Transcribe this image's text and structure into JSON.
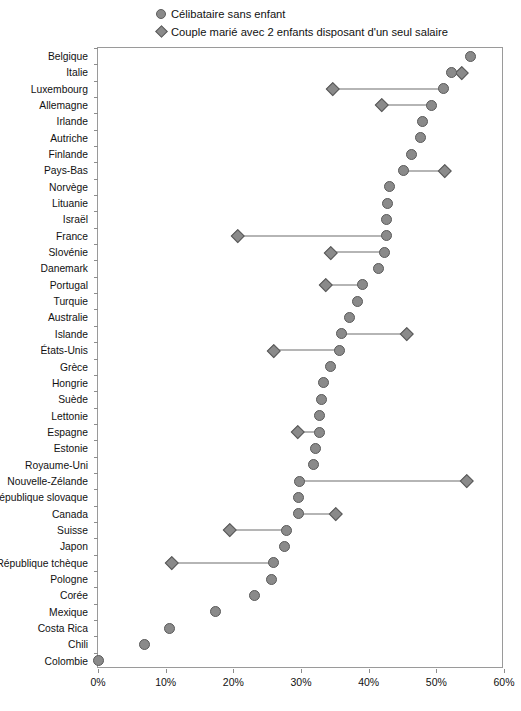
{
  "legend": {
    "position": "top",
    "items": [
      {
        "marker": "circle-icon",
        "label": "Célibataire sans enfant"
      },
      {
        "marker": "diamond-icon",
        "label": "Couple marié avec 2 enfants disposant d'un seul salaire"
      }
    ]
  },
  "axis": {
    "x": {
      "ticks": [
        "0%",
        "10%",
        "20%",
        "30%",
        "40%",
        "50%",
        "60%"
      ],
      "min": 0,
      "max": 60,
      "label": ""
    },
    "y": {
      "label": ""
    }
  },
  "colors": {
    "marker_fill": "#8a8a8a",
    "marker_stroke": "#5a5a5a",
    "connector": "#6d6d6d",
    "frame": "#9a9a9a",
    "text": "#111111",
    "background": "#ffffff"
  },
  "chart_data": {
    "type": "scatter",
    "title": "",
    "subtitle": "",
    "xlabel": "",
    "ylabel": "",
    "xlim": [
      0,
      60
    ],
    "grid": false,
    "legend_position": "top",
    "categories": [
      "Belgique",
      "Italie",
      "Luxembourg",
      "Allemagne",
      "Irlande",
      "Autriche",
      "Finlande",
      "Pays-Bas",
      "Norvège",
      "Lituanie",
      "Israël",
      "France",
      "Slovénie",
      "Danemark",
      "Portugal",
      "Turquie",
      "Australie",
      "Islande",
      "États-Unis",
      "Grèce",
      "Hongrie",
      "Suède",
      "Lettonie",
      "Espagne",
      "Estonie",
      "Royaume-Uni",
      "Nouvelle-Zélande",
      "République slovaque",
      "Canada",
      "Suisse",
      "Japon",
      "République tchèque",
      "Pologne",
      "Corée",
      "Mexique",
      "Costa Rica",
      "Chili",
      "Colombie"
    ],
    "series": [
      {
        "name": "Célibataire sans enfant",
        "marker": "circle",
        "values": [
          55.1,
          52.2,
          51.0,
          49.3,
          48.0,
          47.7,
          46.4,
          45.2,
          43.1,
          42.8,
          42.7,
          42.7,
          42.4,
          41.5,
          39.1,
          38.4,
          37.2,
          36.0,
          35.7,
          34.4,
          33.3,
          33.0,
          32.7,
          32.7,
          32.2,
          31.9,
          29.8,
          29.7,
          29.7,
          27.8,
          27.5,
          25.9,
          25.6,
          23.2,
          17.3,
          10.5,
          6.9,
          0.0
        ]
      },
      {
        "name": "Couple marié avec 2 enfants disposant d'un seul salaire",
        "marker": "diamond",
        "values": [
          null,
          53.8,
          34.7,
          41.9,
          null,
          null,
          null,
          51.3,
          null,
          null,
          null,
          20.7,
          34.4,
          null,
          33.7,
          null,
          null,
          45.6,
          26.0,
          null,
          null,
          null,
          null,
          29.5,
          null,
          null,
          54.5,
          null,
          35.2,
          19.5,
          null,
          10.9,
          null,
          null,
          null,
          null,
          null,
          null
        ]
      }
    ]
  }
}
